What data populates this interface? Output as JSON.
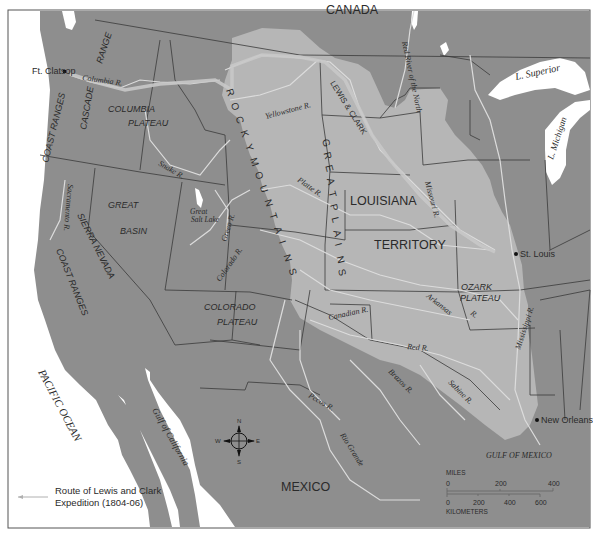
{
  "map": {
    "title": "Route of Lewis and Clark Expedition and the Louisiana Territory",
    "colors": {
      "land": "#8e8e8e",
      "louisiana_territory": "#b6b6b6",
      "water": "#ffffff",
      "river": "#dcdcdc",
      "route": "#c8c8c8",
      "border": "#3a3a3a",
      "text": "#2a2a2a"
    },
    "countries": {
      "canada": "CANADA",
      "mexico": "MEXICO"
    },
    "territory": {
      "line1": "LOUISIANA",
      "line2": "TERRITORY"
    },
    "water_bodies": {
      "pacific": "PACIFIC OCEAN",
      "gulf_mexico": "GULF OF MEXICO",
      "gulf_california": "Gulf of California",
      "lake_superior": "L. Superior",
      "lake_michigan": "L. Michigan",
      "great_salt_lake_1": "Great",
      "great_salt_lake_2": "Salt Lake"
    },
    "physical_regions": {
      "cascade_range_1": "RANGE",
      "cascade_range_2": "CASCADE",
      "coast_ranges_north": "COAST RANGES",
      "coast_ranges_south": "COAST RANGES",
      "columbia_plateau_1": "COLUMBIA",
      "columbia_plateau_2": "PLATEAU",
      "great_basin_1": "GREAT",
      "great_basin_2": "BASIN",
      "sierra_nevada": "SIERRA NEVADA",
      "colorado_plateau_1": "COLORADO",
      "colorado_plateau_2": "PLATEAU",
      "ozark_plateau_1": "OZARK",
      "ozark_plateau_2": "PLATEAU",
      "rocky_mountains": [
        "R",
        "O",
        "C",
        "K",
        "Y",
        "M",
        "O",
        "U",
        "N",
        "T",
        "A",
        "I",
        "N",
        "S"
      ],
      "great_plains": [
        "G",
        "R",
        "E",
        "A",
        "T",
        "P",
        "L",
        "A",
        "I",
        "N",
        "S"
      ]
    },
    "rivers": {
      "columbia": "Columbia R.",
      "snake": "Snake R.",
      "yellowstone": "Yellowstone R.",
      "lewis_clark": "LEWIS & CLARK",
      "red_north": "Red River of the North",
      "missouri": "Missouri R.",
      "platte": "Platte R.",
      "sacramento": "Sacramento R.",
      "green": "Green R.",
      "colorado": "Colorado R.",
      "arkansas_1": "Arkansas",
      "arkansas_2": "R.",
      "canadian": "Canadian R.",
      "red": "Red R.",
      "mississippi": "Mississippi R.",
      "brazos": "Brazos R.",
      "sabine": "Sabine R.",
      "pecos": "Pecos R.",
      "rio_grande": "Rio Grande"
    },
    "cities": {
      "ft_clatsop": "Ft. Clatsop",
      "st_louis": "St. Louis",
      "new_orleans": "New Orleans"
    },
    "compass": {
      "n": "N",
      "s": "S",
      "e": "E",
      "w": "W"
    },
    "legend": {
      "line1": "Route of Lewis and Clark",
      "line2": "Expedition (1804-06)"
    },
    "scale": {
      "miles_label": "MILES",
      "miles_ticks": [
        "0",
        "200",
        "400"
      ],
      "km_label": "KILOMETERS",
      "km_ticks": [
        "0",
        "200",
        "400",
        "600"
      ]
    }
  }
}
